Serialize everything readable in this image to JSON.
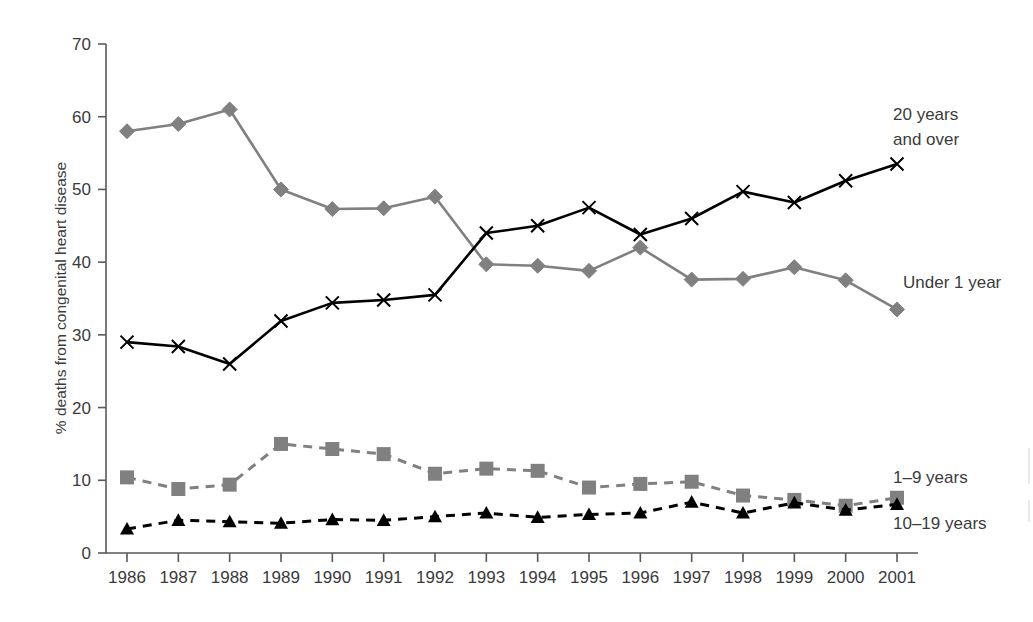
{
  "chart_data": {
    "type": "line",
    "title": "",
    "xlabel": "",
    "ylabel": "% deaths from congenital heart disease",
    "categories": [
      "1986",
      "1987",
      "1988",
      "1989",
      "1990",
      "1991",
      "1992",
      "1993",
      "1994",
      "1995",
      "1996",
      "1997",
      "1998",
      "1999",
      "2000",
      "2001"
    ],
    "xtick_labels": [
      "1986",
      "1987",
      "1988",
      "1989",
      "1990",
      "1991",
      "1992",
      "1993",
      "1994",
      "1995",
      "1996",
      "1997",
      "1998",
      "1999",
      "2000",
      "2001"
    ],
    "ytick_labels": [
      "0",
      "10",
      "20",
      "30",
      "40",
      "50",
      "60",
      "70"
    ],
    "yticks": [
      0,
      10,
      20,
      30,
      40,
      50,
      60,
      70
    ],
    "ylim": [
      0,
      70
    ],
    "grid": false,
    "legend_position": "right-inline",
    "series": [
      {
        "name": "Under 1 year",
        "label": "Under 1 year",
        "color": "#808080",
        "marker": "diamond",
        "dash": "solid",
        "values": [
          58.0,
          59.0,
          61.0,
          50.0,
          47.3,
          47.4,
          49.0,
          39.7,
          39.5,
          38.8,
          42.0,
          37.6,
          37.7,
          39.3,
          37.5,
          33.5
        ]
      },
      {
        "name": "20 years and over",
        "label": "20 years\nand over",
        "label_line1": "20 years",
        "label_line2": "and over",
        "color": "#000000",
        "marker": "x",
        "dash": "solid",
        "values": [
          29.0,
          28.4,
          26.0,
          31.9,
          34.4,
          34.8,
          35.5,
          44.0,
          45.0,
          47.5,
          43.8,
          46.0,
          49.7,
          48.2,
          51.2,
          53.5
        ]
      },
      {
        "name": "1-9 years",
        "label": "1–9 years",
        "color": "#808080",
        "marker": "square",
        "dash": "dashed",
        "values": [
          10.4,
          8.8,
          9.4,
          15.0,
          14.3,
          13.6,
          10.9,
          11.6,
          11.3,
          9.0,
          9.5,
          9.8,
          7.9,
          7.3,
          6.5,
          7.6
        ]
      },
      {
        "name": "10-19 years",
        "label": "10–19 years",
        "color": "#000000",
        "marker": "triangle",
        "dash": "dashed",
        "values": [
          3.3,
          4.5,
          4.3,
          4.1,
          4.6,
          4.5,
          5.0,
          5.5,
          4.9,
          5.3,
          5.5,
          7.0,
          5.5,
          6.9,
          5.9,
          6.7
        ]
      }
    ]
  },
  "colors": {
    "gray_series": "#808080",
    "black_series": "#000000",
    "axis": "#5a5a5a",
    "text": "#3b3b3b",
    "background": "#ffffff"
  }
}
